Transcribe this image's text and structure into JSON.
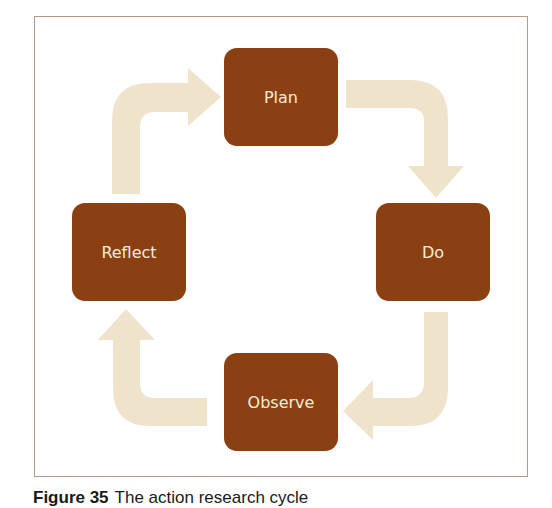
{
  "diagram": {
    "type": "cycle",
    "colors": {
      "node_fill": "#8a4012",
      "node_text": "#f8ecd8",
      "arrow_fill": "#efe3cc",
      "frame_border": "#b99a87"
    },
    "nodes": [
      {
        "id": "plan",
        "label": "Plan"
      },
      {
        "id": "do",
        "label": "Do"
      },
      {
        "id": "observe",
        "label": "Observe"
      },
      {
        "id": "reflect",
        "label": "Reflect"
      }
    ],
    "edges": [
      {
        "from": "plan",
        "to": "do"
      },
      {
        "from": "do",
        "to": "observe"
      },
      {
        "from": "observe",
        "to": "reflect"
      },
      {
        "from": "reflect",
        "to": "plan"
      }
    ]
  },
  "caption": {
    "number": "Figure 35",
    "text": "The action research cycle"
  }
}
